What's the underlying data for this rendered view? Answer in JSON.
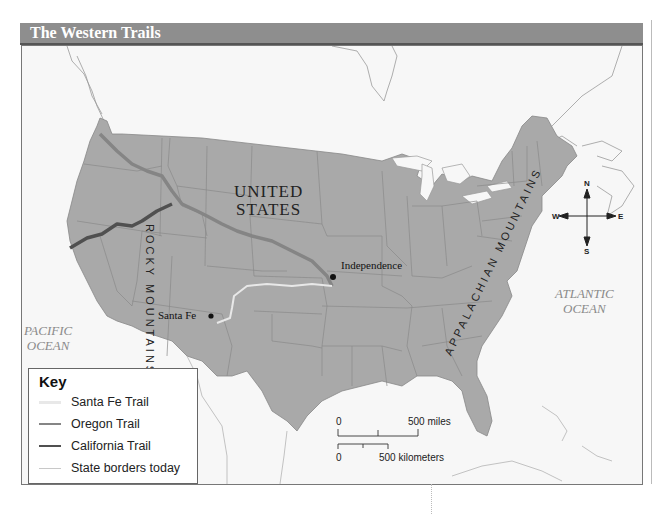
{
  "title": "The Western Trails",
  "labels": {
    "country_line1": "UNITED",
    "country_line2": "STATES",
    "rocky_mountains": "ROCKY MOUNTAINS",
    "appalachian_mountains": "APPALACHIAN MOUNTAINS",
    "pacific_line1": "PACIFIC",
    "pacific_line2": "OCEAN",
    "atlantic_line1": "ATLANTIC",
    "atlantic_line2": "OCEAN"
  },
  "cities": [
    {
      "name": "Independence"
    },
    {
      "name": "Santa Fe"
    }
  ],
  "key": {
    "title": "Key",
    "items": [
      {
        "label": "Santa Fe Trail",
        "color": "#e8e8e8"
      },
      {
        "label": "Oregon Trail",
        "color": "#858585"
      },
      {
        "label": "California Trail",
        "color": "#505050"
      },
      {
        "label": "State borders today",
        "color": "#c8c8c8"
      }
    ]
  },
  "scale": {
    "miles_start": "0",
    "miles_end": "500 miles",
    "km_start": "0",
    "km_end": "500 kilometers"
  },
  "compass": {
    "n": "N",
    "s": "S",
    "e": "E",
    "w": "W"
  },
  "colors": {
    "land_us": "#a9a9a9",
    "water": "#f7f7f7",
    "title_bar": "#8e8e8e",
    "santa_fe_trail": "#e8e8e8",
    "oregon_trail": "#858585",
    "california_trail": "#505050"
  }
}
